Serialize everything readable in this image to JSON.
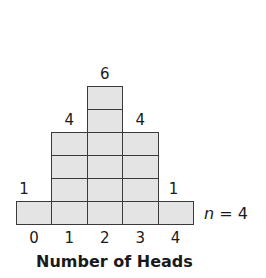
{
  "chart_data": {
    "type": "bar",
    "subtype": "stacked-unit-squares",
    "title": "",
    "categories": [
      "0",
      "1",
      "2",
      "3",
      "4"
    ],
    "values": [
      1,
      4,
      6,
      4,
      1
    ],
    "value_labels": [
      "1",
      "4",
      "6",
      "4",
      "1"
    ],
    "xlabel": "Number of Heads",
    "ylabel": "",
    "annotation": "n = 4",
    "annotation_var": "n",
    "annotation_value": "= 4",
    "grid": false,
    "legend": null,
    "colors": {
      "fill": "#e4e4e4",
      "stroke": "#3a3a3a"
    }
  }
}
